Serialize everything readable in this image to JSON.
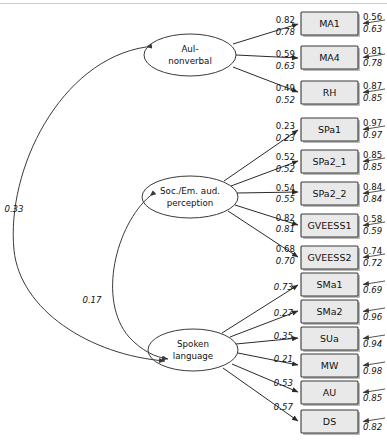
{
  "diagram": {
    "type": "structural-equation-model-path-diagram",
    "latents": [
      {
        "id": "aui",
        "label_line1": "AuI-",
        "label_line2": "nonverbal"
      },
      {
        "id": "soc",
        "label_line1": "Soc./Em. aud.",
        "label_line2": "perception"
      },
      {
        "id": "spk",
        "label_line1": "Spoken",
        "label_line2": "language"
      }
    ],
    "covariances": [
      {
        "from": "aui",
        "to": "spk",
        "value": "0.33"
      },
      {
        "from": "soc",
        "to": "spk",
        "value": "0.17"
      }
    ],
    "groups": [
      {
        "latent": "aui",
        "indicators": [
          {
            "name": "MA1",
            "loading": "0.82",
            "loading_alt": "0.78",
            "residual": "0.56",
            "residual_alt": "0.63"
          },
          {
            "name": "MA4",
            "loading": "0.59",
            "loading_alt": "0.63",
            "residual": "0.81",
            "residual_alt": "0.78"
          },
          {
            "name": "RH",
            "loading": "0.49",
            "loading_alt": "0.52",
            "residual": "0.87",
            "residual_alt": "0.85"
          }
        ]
      },
      {
        "latent": "soc",
        "indicators": [
          {
            "name": "SPa1",
            "loading": "0.23",
            "loading_alt": "0.23",
            "residual": "0.97",
            "residual_alt": "0.97"
          },
          {
            "name": "SPa2_1",
            "loading": "0.52",
            "loading_alt": "0.52",
            "residual": "0.85",
            "residual_alt": "0.85"
          },
          {
            "name": "SPa2_2",
            "loading": "0.54",
            "loading_alt": "0.55",
            "residual": "0.84",
            "residual_alt": "0.84"
          },
          {
            "name": "GVEESS1",
            "loading": "0.82",
            "loading_alt": "0.81",
            "residual": "0.58",
            "residual_alt": "0.59"
          },
          {
            "name": "GVEESS2",
            "loading": "0.68",
            "loading_alt": "0.70",
            "residual": "0.74",
            "residual_alt": "0.72"
          }
        ]
      },
      {
        "latent": "spk",
        "indicators": [
          {
            "name": "SMa1",
            "loading": "",
            "loading_alt": "0.73",
            "residual": "",
            "residual_alt": "0.69"
          },
          {
            "name": "SMa2",
            "loading": "",
            "loading_alt": "0.27",
            "residual": "",
            "residual_alt": "0.96"
          },
          {
            "name": "SUa",
            "loading": "",
            "loading_alt": "0.35",
            "residual": "",
            "residual_alt": "0.94"
          },
          {
            "name": "MW",
            "loading": "",
            "loading_alt": "0.21",
            "residual": "",
            "residual_alt": "0.98"
          },
          {
            "name": "AU",
            "loading": "",
            "loading_alt": "0.53",
            "residual": "",
            "residual_alt": "0.85"
          },
          {
            "name": "DS",
            "loading": "",
            "loading_alt": "0.57",
            "residual": "",
            "residual_alt": "0.82"
          }
        ]
      }
    ],
    "colors": {
      "box_fill": "#e9e9e9",
      "box_stroke": "#3a3a3a",
      "ellipse_fill": "#ffffff",
      "edge": "#2a2a2a",
      "text": "#111111",
      "background": "#ffffff"
    }
  }
}
